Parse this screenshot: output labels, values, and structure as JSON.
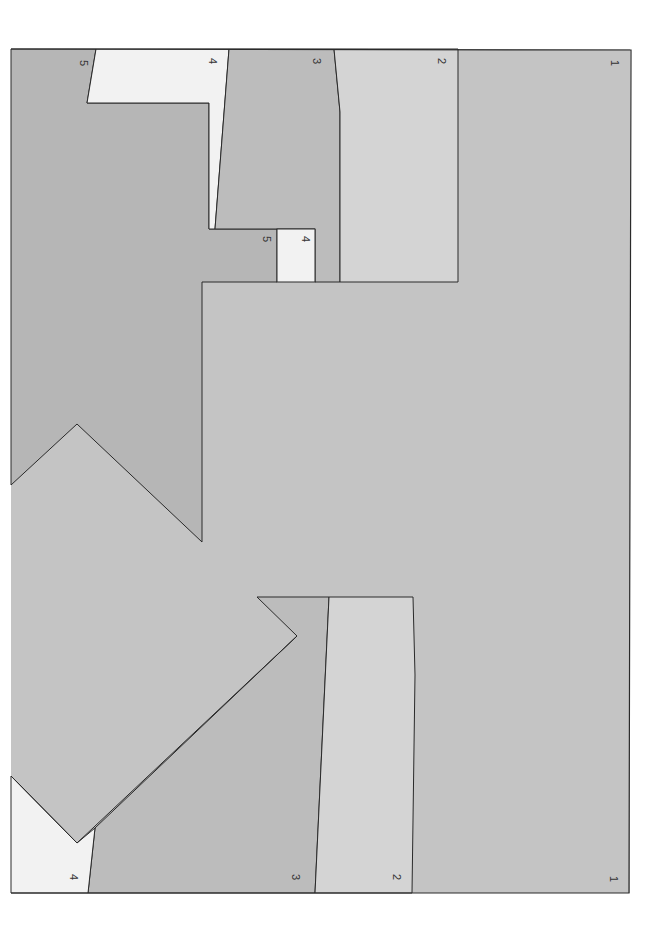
{
  "diagram": {
    "type": "cross-section",
    "colors": {
      "background": "#ffffff",
      "unit_1": "#c4c4c4",
      "unit_2": "#d4d4d4",
      "unit_3": "#bcbcbc",
      "unit_4": "#f2f2f2",
      "unit_5": "#b6b6b6",
      "outline": "#2a2a2a"
    },
    "labels": {
      "top_1": "1",
      "top_2": "2",
      "top_3": "3",
      "top_4": "4",
      "top_5": "5",
      "inset_4": "4",
      "inset_5": "5",
      "bottom_1": "1",
      "bottom_2": "2",
      "bottom_3": "3",
      "bottom_4": "4"
    }
  }
}
